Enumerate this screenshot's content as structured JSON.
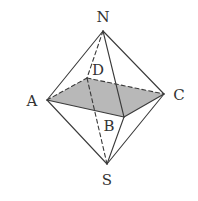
{
  "diagram": {
    "colors": {
      "stroke": "#3a3a3a",
      "shade": "#b8b8b8",
      "label": "#333333",
      "background": "#ffffff"
    },
    "vertices": {
      "N": {
        "label": "N",
        "x": 103,
        "y": 31,
        "lx": 103,
        "ly": 22
      },
      "A": {
        "label": "A",
        "x": 47,
        "y": 100,
        "lx": 32,
        "ly": 106
      },
      "B": {
        "label": "B",
        "x": 124,
        "y": 117,
        "lx": 109,
        "ly": 131
      },
      "C": {
        "label": "C",
        "x": 164,
        "y": 94,
        "lx": 179,
        "ly": 100
      },
      "D": {
        "label": "D",
        "x": 87,
        "y": 78,
        "lx": 98,
        "ly": 75
      },
      "S": {
        "label": "S",
        "x": 107,
        "y": 164,
        "lx": 107,
        "ly": 185
      }
    },
    "shaded_face": [
      "A",
      "B",
      "C",
      "D"
    ],
    "edges_solid": [
      [
        "N",
        "A"
      ],
      [
        "N",
        "B"
      ],
      [
        "N",
        "C"
      ],
      [
        "S",
        "A"
      ],
      [
        "S",
        "B"
      ],
      [
        "S",
        "C"
      ],
      [
        "A",
        "B"
      ],
      [
        "B",
        "C"
      ]
    ],
    "edges_dashed": [
      [
        "N",
        "D"
      ],
      [
        "S",
        "D"
      ],
      [
        "A",
        "D"
      ],
      [
        "D",
        "C"
      ]
    ]
  }
}
